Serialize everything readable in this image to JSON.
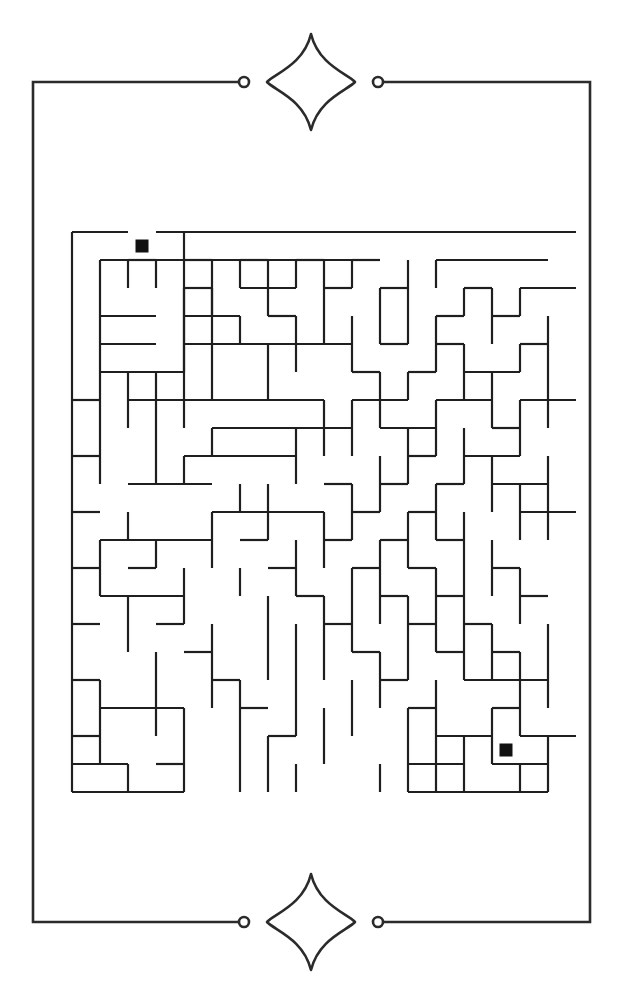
{
  "page": {
    "background_color": "#ffffff",
    "width": 996,
    "height": 624
  },
  "frame": {
    "stroke_color": "#2b2b2b",
    "stroke_width": 2.6,
    "left": 33,
    "top": 82,
    "right": 590,
    "bottom": 922,
    "top_gap_left_x": 244,
    "top_gap_right_x": 378,
    "bottom_gap_left_x": 244,
    "bottom_gap_right_x": 378,
    "endcap_radius": 5.0,
    "ornament": {
      "name": "four-point-sparkle",
      "top_center_x": 311,
      "top_center_y": 82,
      "bottom_center_x": 311,
      "bottom_center_y": 922,
      "half_width": 44,
      "half_height": 48
    }
  },
  "maze": {
    "stroke_color": "#1f1f1f",
    "stroke_width": 2.2,
    "origin_x": 72,
    "origin_y": 232,
    "cell": 28,
    "cols": 18,
    "rows": 20,
    "marker_color": "#111111",
    "marker_size": 13,
    "start": {
      "label": "start-marker",
      "col": 2,
      "row": 0
    },
    "end": {
      "label": "end-marker",
      "col": 15,
      "row": 18
    },
    "h_walls": [
      [
        0,
        0,
        2
      ],
      [
        3,
        0,
        18
      ],
      [
        1,
        1,
        10
      ],
      [
        2,
        1,
        3
      ],
      [
        4,
        1,
        5
      ],
      [
        6,
        1,
        7
      ],
      [
        8,
        1,
        9
      ],
      [
        10,
        1,
        11
      ],
      [
        13,
        1,
        17
      ],
      [
        4,
        2,
        5
      ],
      [
        6,
        2,
        8
      ],
      [
        9,
        2,
        10
      ],
      [
        11,
        2,
        12
      ],
      [
        14,
        2,
        15
      ],
      [
        16,
        2,
        18
      ],
      [
        1,
        3,
        3
      ],
      [
        4,
        3,
        6
      ],
      [
        7,
        3,
        8
      ],
      [
        13,
        3,
        14
      ],
      [
        15,
        3,
        16
      ],
      [
        1,
        4,
        3
      ],
      [
        4,
        4,
        10
      ],
      [
        11,
        4,
        12
      ],
      [
        13,
        4,
        14
      ],
      [
        16,
        4,
        17
      ],
      [
        1,
        5,
        4
      ],
      [
        10,
        5,
        11
      ],
      [
        12,
        5,
        13
      ],
      [
        14,
        5,
        16
      ],
      [
        0,
        6,
        1
      ],
      [
        2,
        6,
        4
      ],
      [
        4,
        6,
        9
      ],
      [
        10,
        6,
        12
      ],
      [
        13,
        6,
        15
      ],
      [
        16,
        6,
        18
      ],
      [
        5,
        7,
        10
      ],
      [
        11,
        7,
        13
      ],
      [
        15,
        7,
        16
      ],
      [
        0,
        8,
        1
      ],
      [
        4,
        8,
        8
      ],
      [
        12,
        8,
        13
      ],
      [
        14,
        8,
        16
      ],
      [
        2,
        9,
        5
      ],
      [
        9,
        9,
        10
      ],
      [
        11,
        9,
        12
      ],
      [
        13,
        9,
        14
      ],
      [
        15,
        9,
        17
      ],
      [
        0,
        10,
        1
      ],
      [
        5,
        10,
        9
      ],
      [
        10,
        10,
        11
      ],
      [
        12,
        10,
        13
      ],
      [
        16,
        10,
        18
      ],
      [
        1,
        11,
        5
      ],
      [
        6,
        11,
        7
      ],
      [
        9,
        11,
        10
      ],
      [
        11,
        11,
        12
      ],
      [
        13,
        11,
        14
      ],
      [
        0,
        12,
        1
      ],
      [
        2,
        12,
        3
      ],
      [
        7,
        12,
        8
      ],
      [
        10,
        12,
        11
      ],
      [
        12,
        12,
        13
      ],
      [
        15,
        12,
        16
      ],
      [
        1,
        13,
        4
      ],
      [
        8,
        13,
        9
      ],
      [
        11,
        13,
        12
      ],
      [
        13,
        13,
        14
      ],
      [
        16,
        13,
        17
      ],
      [
        0,
        14,
        1
      ],
      [
        3,
        14,
        4
      ],
      [
        9,
        14,
        10
      ],
      [
        12,
        14,
        13
      ],
      [
        14,
        14,
        15
      ],
      [
        4,
        15,
        5
      ],
      [
        10,
        15,
        11
      ],
      [
        13,
        15,
        14
      ],
      [
        15,
        15,
        16
      ],
      [
        0,
        16,
        1
      ],
      [
        5,
        16,
        6
      ],
      [
        11,
        16,
        12
      ],
      [
        14,
        16,
        17
      ],
      [
        1,
        17,
        4
      ],
      [
        6,
        17,
        7
      ],
      [
        12,
        17,
        13
      ],
      [
        15,
        17,
        16
      ],
      [
        0,
        18,
        1
      ],
      [
        7,
        18,
        8
      ],
      [
        13,
        18,
        15
      ],
      [
        16,
        18,
        18
      ],
      [
        0,
        19,
        2
      ],
      [
        3,
        19,
        4
      ],
      [
        12,
        19,
        14
      ],
      [
        15,
        19,
        17
      ],
      [
        0,
        20,
        4
      ],
      [
        12,
        20,
        17
      ]
    ],
    "v_walls": [
      [
        0,
        0,
        6
      ],
      [
        0,
        6,
        10
      ],
      [
        0,
        10,
        14
      ],
      [
        0,
        14,
        20
      ],
      [
        4,
        0,
        1
      ],
      [
        4,
        1,
        6
      ],
      [
        1,
        1,
        5
      ],
      [
        2,
        1,
        2
      ],
      [
        3,
        1,
        2
      ],
      [
        5,
        1,
        6
      ],
      [
        6,
        1,
        2
      ],
      [
        7,
        1,
        3
      ],
      [
        8,
        1,
        2
      ],
      [
        9,
        1,
        3
      ],
      [
        10,
        1,
        2
      ],
      [
        12,
        1,
        3
      ],
      [
        13,
        1,
        2
      ],
      [
        4,
        2,
        4
      ],
      [
        5,
        2,
        3
      ],
      [
        11,
        2,
        4
      ],
      [
        14,
        2,
        3
      ],
      [
        15,
        2,
        4
      ],
      [
        16,
        2,
        3
      ],
      [
        6,
        3,
        4
      ],
      [
        8,
        3,
        5
      ],
      [
        9,
        3,
        4
      ],
      [
        10,
        3,
        5
      ],
      [
        12,
        3,
        4
      ],
      [
        13,
        3,
        5
      ],
      [
        17,
        3,
        5
      ],
      [
        4,
        4,
        5
      ],
      [
        7,
        4,
        6
      ],
      [
        14,
        4,
        6
      ],
      [
        16,
        4,
        5
      ],
      [
        1,
        5,
        9
      ],
      [
        2,
        5,
        7
      ],
      [
        3,
        5,
        9
      ],
      [
        11,
        5,
        7
      ],
      [
        12,
        5,
        6
      ],
      [
        15,
        5,
        7
      ],
      [
        17,
        5,
        7
      ],
      [
        4,
        6,
        7
      ],
      [
        9,
        6,
        8
      ],
      [
        10,
        6,
        8
      ],
      [
        13,
        6,
        8
      ],
      [
        16,
        6,
        8
      ],
      [
        5,
        7,
        8
      ],
      [
        8,
        7,
        9
      ],
      [
        12,
        7,
        9
      ],
      [
        14,
        7,
        9
      ],
      [
        4,
        8,
        9
      ],
      [
        11,
        8,
        10
      ],
      [
        15,
        8,
        10
      ],
      [
        17,
        8,
        11
      ],
      [
        6,
        9,
        10
      ],
      [
        7,
        9,
        11
      ],
      [
        10,
        9,
        11
      ],
      [
        13,
        9,
        11
      ],
      [
        16,
        9,
        11
      ],
      [
        2,
        10,
        11
      ],
      [
        5,
        10,
        12
      ],
      [
        9,
        10,
        12
      ],
      [
        12,
        10,
        12
      ],
      [
        14,
        10,
        13
      ],
      [
        1,
        11,
        13
      ],
      [
        3,
        11,
        12
      ],
      [
        8,
        11,
        13
      ],
      [
        11,
        11,
        14
      ],
      [
        15,
        11,
        13
      ],
      [
        4,
        12,
        14
      ],
      [
        6,
        12,
        13
      ],
      [
        10,
        12,
        15
      ],
      [
        13,
        12,
        15
      ],
      [
        16,
        12,
        14
      ],
      [
        2,
        13,
        15
      ],
      [
        7,
        13,
        16
      ],
      [
        9,
        13,
        16
      ],
      [
        12,
        13,
        16
      ],
      [
        14,
        13,
        16
      ],
      [
        5,
        14,
        17
      ],
      [
        8,
        14,
        18
      ],
      [
        15,
        14,
        16
      ],
      [
        17,
        14,
        17
      ],
      [
        3,
        15,
        18
      ],
      [
        11,
        15,
        17
      ],
      [
        16,
        15,
        18
      ],
      [
        1,
        16,
        19
      ],
      [
        6,
        16,
        20
      ],
      [
        10,
        16,
        18
      ],
      [
        13,
        16,
        19
      ],
      [
        4,
        17,
        20
      ],
      [
        9,
        17,
        19
      ],
      [
        12,
        17,
        20
      ],
      [
        15,
        17,
        19
      ],
      [
        7,
        18,
        20
      ],
      [
        14,
        18,
        20
      ],
      [
        17,
        18,
        20
      ],
      [
        2,
        19,
        20
      ],
      [
        8,
        19,
        20
      ],
      [
        11,
        19,
        20
      ],
      [
        13,
        19,
        20
      ],
      [
        16,
        19,
        20
      ]
    ]
  }
}
